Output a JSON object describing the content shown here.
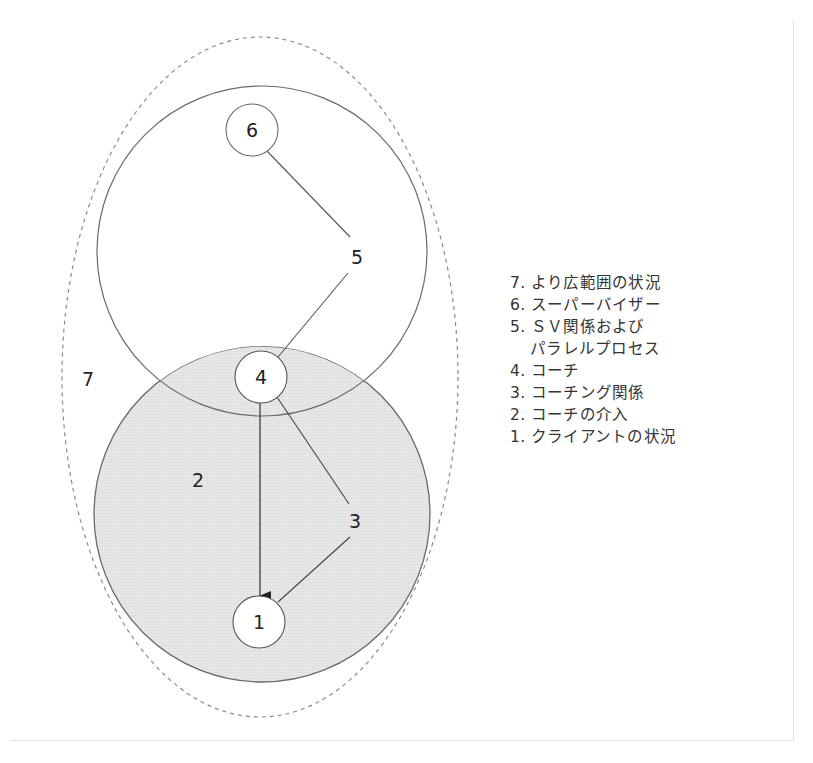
{
  "diagram": {
    "type": "nested-circles",
    "regions": [
      {
        "id": "7",
        "label": "7",
        "shape": "dashed-ellipse"
      },
      {
        "id": "upper",
        "shape": "circle",
        "fill": "#ffffff"
      },
      {
        "id": "2",
        "label": "2",
        "shape": "circle",
        "fill": "#e4e4e4"
      }
    ],
    "nodes": [
      {
        "id": "6",
        "label": "6"
      },
      {
        "id": "5",
        "label": "5"
      },
      {
        "id": "4",
        "label": "4"
      },
      {
        "id": "3",
        "label": "3"
      },
      {
        "id": "2",
        "label": "2"
      },
      {
        "id": "1",
        "label": "1"
      },
      {
        "id": "7",
        "label": "7"
      }
    ],
    "edges": [
      {
        "from": "6",
        "to": "5",
        "type": "line"
      },
      {
        "from": "5",
        "to": "4",
        "type": "line"
      },
      {
        "from": "4",
        "to": "3",
        "type": "line"
      },
      {
        "from": "3",
        "to": "1",
        "type": "line"
      },
      {
        "from": "4",
        "to": "1",
        "type": "arrow"
      }
    ],
    "colors": {
      "stroke": "#6a6a6a",
      "lower_fill": "#e3e3e3",
      "dashed": "#8a8a8a",
      "text": "#222222"
    }
  },
  "legend": {
    "items": [
      {
        "num": "7.",
        "text": "より広範囲の状況"
      },
      {
        "num": "6.",
        "text": "スーパーバイザー"
      },
      {
        "num": "5.",
        "text": "ＳＶ関係および",
        "continuation": "パラレルプロセス"
      },
      {
        "num": "4.",
        "text": "コーチ"
      },
      {
        "num": "3.",
        "text": "コーチング関係"
      },
      {
        "num": "2.",
        "text": "コーチの介入"
      },
      {
        "num": "1.",
        "text": "クライアントの状況"
      }
    ]
  }
}
